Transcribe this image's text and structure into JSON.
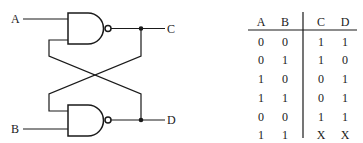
{
  "circuit": {
    "type": "SR latch (cross-coupled NAND gates)",
    "gates": [
      {
        "id": "top",
        "kind": "NAND",
        "inputs": [
          "A",
          "D"
        ],
        "output": "C"
      },
      {
        "id": "bottom",
        "kind": "NAND",
        "inputs": [
          "C",
          "B"
        ],
        "output": "D"
      }
    ],
    "labels": {
      "A": "A",
      "B": "B",
      "C": "C",
      "D": "D"
    }
  },
  "truth_table": {
    "headers": [
      "A",
      "B",
      "C",
      "D"
    ],
    "rows": [
      [
        "0",
        "0",
        "1",
        "1"
      ],
      [
        "0",
        "1",
        "1",
        "0"
      ],
      [
        "1",
        "0",
        "0",
        "1"
      ],
      [
        "1",
        "1",
        "0",
        "1"
      ],
      [
        "0",
        "0",
        "1",
        "1"
      ],
      [
        "1",
        "1",
        "X",
        "X"
      ]
    ]
  }
}
